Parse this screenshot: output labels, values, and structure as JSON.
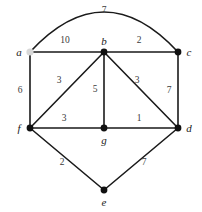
{
  "figure": {
    "kind": "weighted-undirected-graph",
    "width": 202,
    "height": 212,
    "background": "#ffffff",
    "edge_color": "#1a1a1a",
    "vertex_color": "#111111",
    "highlight_color": "#d8d8d8",
    "label_color": "#1a1a1a",
    "weight_color": "#3a3a3a"
  },
  "chart_data": {
    "type": "diagram",
    "title": "",
    "nodes": [
      {
        "id": "a",
        "label": "a",
        "x": 30,
        "y": 52,
        "style": "highlighted",
        "label_pos": "left"
      },
      {
        "id": "b",
        "label": "b",
        "x": 104,
        "y": 52,
        "style": "filled",
        "label_pos": "top"
      },
      {
        "id": "c",
        "label": "c",
        "x": 178,
        "y": 52,
        "style": "filled",
        "label_pos": "right"
      },
      {
        "id": "f",
        "label": "f",
        "x": 30,
        "y": 128,
        "style": "filled",
        "label_pos": "left"
      },
      {
        "id": "g",
        "label": "g",
        "x": 104,
        "y": 128,
        "style": "filled",
        "label_pos": "bottom"
      },
      {
        "id": "d",
        "label": "d",
        "x": 178,
        "y": 128,
        "style": "filled",
        "label_pos": "right"
      },
      {
        "id": "e",
        "label": "e",
        "x": 104,
        "y": 190,
        "style": "filled",
        "label_pos": "bottom"
      }
    ],
    "edges": [
      {
        "from": "a",
        "to": "c",
        "weight": 7,
        "shape": "arc",
        "weight_x": 104,
        "weight_y": 11
      },
      {
        "from": "a",
        "to": "b",
        "weight": 10,
        "shape": "straight",
        "weight_x": 65,
        "weight_y": 41
      },
      {
        "from": "b",
        "to": "c",
        "weight": 2,
        "shape": "straight",
        "weight_x": 139,
        "weight_y": 41
      },
      {
        "from": "a",
        "to": "f",
        "weight": 6,
        "shape": "straight",
        "weight_x": 20,
        "weight_y": 91
      },
      {
        "from": "b",
        "to": "f",
        "weight": 3,
        "shape": "straight",
        "weight_x": 59,
        "weight_y": 81
      },
      {
        "from": "b",
        "to": "g",
        "weight": 5,
        "shape": "straight",
        "weight_x": 95,
        "weight_y": 90
      },
      {
        "from": "b",
        "to": "d",
        "weight": 3,
        "shape": "straight",
        "weight_x": 137,
        "weight_y": 81
      },
      {
        "from": "c",
        "to": "d",
        "weight": 7,
        "shape": "straight",
        "weight_x": 169,
        "weight_y": 91
      },
      {
        "from": "f",
        "to": "g",
        "weight": 3,
        "shape": "straight",
        "weight_x": 64,
        "weight_y": 119
      },
      {
        "from": "g",
        "to": "d",
        "weight": 1,
        "shape": "straight",
        "weight_x": 139,
        "weight_y": 119
      },
      {
        "from": "f",
        "to": "e",
        "weight": 2,
        "shape": "straight",
        "weight_x": 62,
        "weight_y": 163
      },
      {
        "from": "e",
        "to": "d",
        "weight": 7,
        "shape": "straight",
        "weight_x": 144,
        "weight_y": 163
      }
    ],
    "node_labels": [
      "a",
      "b",
      "c",
      "d",
      "e",
      "f",
      "g"
    ],
    "weights": [
      7,
      10,
      2,
      6,
      3,
      5,
      3,
      7,
      3,
      1,
      2,
      7
    ]
  }
}
